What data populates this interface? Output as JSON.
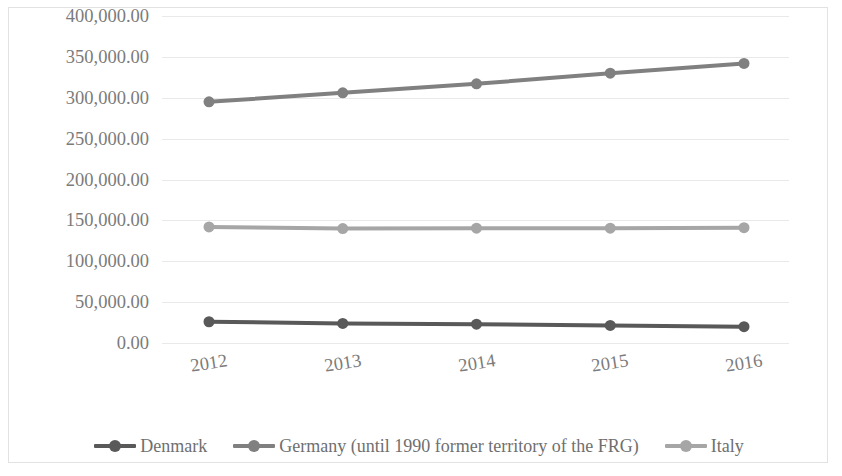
{
  "chart_data": {
    "type": "line",
    "title": "",
    "subtitle": "",
    "xlabel": "",
    "ylabel": "",
    "categories": [
      "2012",
      "2013",
      "2014",
      "2015",
      "2016"
    ],
    "series": [
      {
        "name": "Denmark",
        "color": "#595959",
        "values": [
          26000,
          24000,
          23000,
          21500,
          20000
        ]
      },
      {
        "name": "Germany (until 1990 former territory of the FRG)",
        "color": "#808080",
        "values": [
          295000,
          306000,
          317000,
          330000,
          342000
        ]
      },
      {
        "name": "Italy",
        "color": "#a6a6a6",
        "values": [
          142000,
          140000,
          140500,
          140500,
          141000
        ]
      }
    ],
    "ylim": [
      0,
      400000
    ],
    "yticks": [
      0,
      50000,
      100000,
      150000,
      200000,
      250000,
      300000,
      350000,
      400000
    ],
    "ytick_labels": [
      "0.00",
      "50,000.00",
      "100,000.00",
      "150,000.00",
      "200,000.00",
      "250,000.00",
      "300,000.00",
      "350,000.00",
      "400,000.00"
    ],
    "grid": true,
    "grid_color": "#e9e9e9",
    "legend_position": "bottom",
    "marker": "circle",
    "background": "#ffffff",
    "border_color": "#e2e2e2"
  }
}
